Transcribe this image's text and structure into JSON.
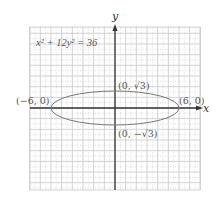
{
  "chart_data": {
    "type": "line",
    "title": "",
    "equation": "x² + 12y² = 36",
    "curve": "ellipse",
    "center": [
      0,
      0
    ],
    "semi_major": 6,
    "semi_minor": 1.732,
    "xlabel": "x",
    "ylabel": "y",
    "xlim": [
      -8,
      8
    ],
    "ylim": [
      -8,
      8
    ],
    "grid": true,
    "points": [
      {
        "label": "(−6, 0)",
        "x": -6,
        "y": 0
      },
      {
        "label": "(6, 0)",
        "x": 6,
        "y": 0
      },
      {
        "label": "(0, √3)",
        "x": 0,
        "y": 1.732
      },
      {
        "label": "(0, −√3)",
        "x": 0,
        "y": -1.732
      }
    ]
  },
  "labels": {
    "equation": "x² + 12y² = 36",
    "x_axis": "x",
    "y_axis": "y",
    "left_vertex": "(−6, 0)",
    "right_vertex": "(6, 0)",
    "top_covertex": "(0, √3)",
    "bottom_covertex": "(0, −√3)"
  },
  "colors": {
    "grid": "#c8c8c8",
    "axis": "#333333",
    "curve": "#777777"
  }
}
